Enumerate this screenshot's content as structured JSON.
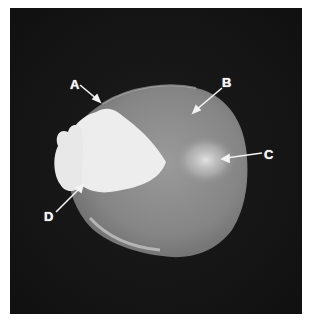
{
  "figure": {
    "background_color": "#151515",
    "kernel_color": "#8a8a8a",
    "white_region_color": "#ececec",
    "labels": [
      {
        "id": "A",
        "text": "A"
      },
      {
        "id": "B",
        "text": "B"
      },
      {
        "id": "C",
        "text": "C"
      },
      {
        "id": "D",
        "text": "D"
      }
    ]
  }
}
